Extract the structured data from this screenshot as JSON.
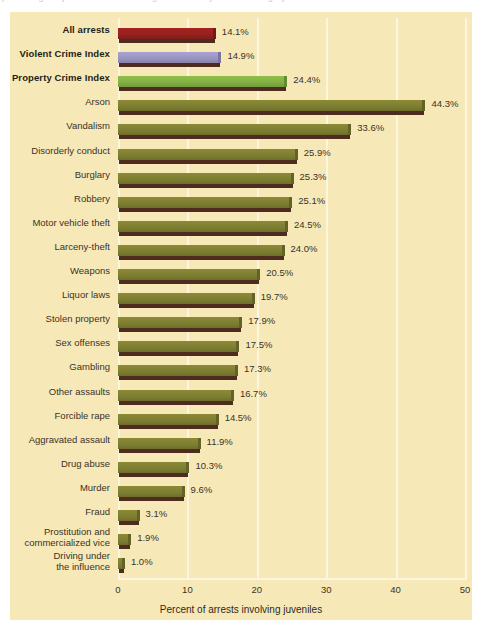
{
  "figure": {
    "clipped_caption_fragment": "percentage of juvenile arrests among all arrests by offense category",
    "panel_bg": "#f7e8b8",
    "gridline_color": "#fdf5dd",
    "text_color": "#3a3326"
  },
  "chart_data": {
    "type": "bar",
    "orientation": "horizontal",
    "title": "",
    "xlabel": "Percent of arrests involving juveniles",
    "ylabel": "",
    "xlim": [
      0,
      50
    ],
    "xticks": [
      0,
      10,
      20,
      30,
      40,
      50
    ],
    "xtick_labels": [
      "0",
      "10",
      "20",
      "30",
      "40",
      "50"
    ],
    "grid": "vertical",
    "legend": "none",
    "value_suffix": "%",
    "categories": [
      "All arrests",
      "Violent Crime Index",
      "Property Crime Index",
      "Arson",
      "Vandalism",
      "Disorderly conduct",
      "Burglary",
      "Robbery",
      "Motor vehicle theft",
      "Larceny-theft",
      "Weapons",
      "Liquor laws",
      "Stolen property",
      "Sex offenses",
      "Gambling",
      "Other assaults",
      "Forcible rape",
      "Aggravated assault",
      "Drug abuse",
      "Murder",
      "Fraud",
      "Prostitution and commercialized vice",
      "Driving under the influence"
    ],
    "values": [
      14.1,
      14.9,
      24.4,
      44.3,
      33.6,
      25.9,
      25.3,
      25.1,
      24.5,
      24.0,
      20.5,
      19.7,
      17.9,
      17.5,
      17.3,
      16.7,
      14.5,
      11.9,
      10.3,
      9.6,
      3.1,
      1.9,
      1.0
    ],
    "value_labels": [
      "14.1%",
      "14.9%",
      "24.4%",
      "44.3%",
      "33.6%",
      "25.9%",
      "25.3%",
      "25.1%",
      "24.5%",
      "24.0%",
      "20.5%",
      "19.7%",
      "17.9%",
      "17.5%",
      "17.3%",
      "16.7%",
      "14.5%",
      "11.9%",
      "10.3%",
      "9.6%",
      "3.1%",
      "1.9%",
      "1.0%"
    ],
    "bar_colors": [
      "#a32421",
      "#a9a2d4",
      "#8fc04a",
      "#8a8a36",
      "#8a8a36",
      "#8a8a36",
      "#8a8a36",
      "#8a8a36",
      "#8a8a36",
      "#8a8a36",
      "#8a8a36",
      "#8a8a36",
      "#8a8a36",
      "#8a8a36",
      "#8a8a36",
      "#8a8a36",
      "#8a8a36",
      "#8a8a36",
      "#8a8a36",
      "#8a8a36",
      "#8a8a36",
      "#8a8a36",
      "#8a8a36"
    ],
    "emphasized": [
      true,
      true,
      true,
      false,
      false,
      false,
      false,
      false,
      false,
      false,
      false,
      false,
      false,
      false,
      false,
      false,
      false,
      false,
      false,
      false,
      false,
      false,
      false
    ],
    "label_lines": [
      [
        "All arrests"
      ],
      [
        "Violent Crime Index"
      ],
      [
        "Property Crime Index"
      ],
      [
        "Arson"
      ],
      [
        "Vandalism"
      ],
      [
        "Disorderly conduct"
      ],
      [
        "Burglary"
      ],
      [
        "Robbery"
      ],
      [
        "Motor vehicle theft"
      ],
      [
        "Larceny-theft"
      ],
      [
        "Weapons"
      ],
      [
        "Liquor laws"
      ],
      [
        "Stolen property"
      ],
      [
        "Sex offenses"
      ],
      [
        "Gambling"
      ],
      [
        "Other assaults"
      ],
      [
        "Forcible rape"
      ],
      [
        "Aggravated assault"
      ],
      [
        "Drug abuse"
      ],
      [
        "Murder"
      ],
      [
        "Fraud"
      ],
      [
        "Prostitution and",
        "commercialized vice"
      ],
      [
        "Driving under",
        "the influence"
      ]
    ]
  }
}
